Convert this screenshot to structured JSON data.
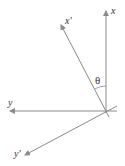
{
  "diagram": {
    "type": "coordinate-rotation",
    "labels": {
      "x": "x",
      "x_prime": "x'",
      "y": "y",
      "y_prime": "y'",
      "angle": "θ"
    },
    "colors": {
      "axis": "#8a8a8a",
      "text": "#333333",
      "background": "#ffffff"
    }
  }
}
